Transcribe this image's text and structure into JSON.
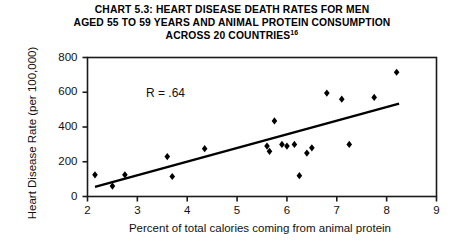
{
  "title": {
    "line1": "CHART 5.3: HEART DISEASE DEATH RATES FOR MEN",
    "line2": "AGED 55 TO 59 YEARS AND ANIMAL PROTEIN CONSUMPTION",
    "line3": "ACROSS 20 COUNTRIES",
    "footnote_marker": "16"
  },
  "annotation": {
    "correlation": "R =  .64"
  },
  "chart_data": {
    "type": "scatter",
    "title": "CHART 5.3: HEART DISEASE DEATH RATES FOR MEN AGED 55 TO 59 YEARS AND ANIMAL PROTEIN CONSUMPTION ACROSS 20 COUNTRIES",
    "xlabel": "Percent of total calories coming from animal protein",
    "ylabel": "Heart Disease Rate (per 100,000)",
    "xlim": [
      2,
      9
    ],
    "ylim": [
      0,
      800
    ],
    "xticks": [
      2,
      3,
      4,
      5,
      6,
      7,
      8,
      9
    ],
    "yticks": [
      0,
      200,
      400,
      600,
      800
    ],
    "xtick_labels": [
      "2",
      "3",
      "4",
      "5",
      "6",
      "7",
      "8",
      "9"
    ],
    "ytick_labels": [
      "0",
      "200",
      "400",
      "600",
      "800"
    ],
    "grid": false,
    "legend": "none",
    "marker": "diamond",
    "marker_color": "#000000",
    "correlation_r": 0.64,
    "points": [
      {
        "x": 2.15,
        "y": 125
      },
      {
        "x": 2.5,
        "y": 60
      },
      {
        "x": 2.75,
        "y": 125
      },
      {
        "x": 3.6,
        "y": 230
      },
      {
        "x": 3.7,
        "y": 115
      },
      {
        "x": 4.35,
        "y": 275
      },
      {
        "x": 5.6,
        "y": 290
      },
      {
        "x": 5.65,
        "y": 260
      },
      {
        "x": 5.75,
        "y": 435
      },
      {
        "x": 5.9,
        "y": 300
      },
      {
        "x": 6.0,
        "y": 290
      },
      {
        "x": 6.15,
        "y": 300
      },
      {
        "x": 6.25,
        "y": 120
      },
      {
        "x": 6.4,
        "y": 250
      },
      {
        "x": 6.5,
        "y": 280
      },
      {
        "x": 6.8,
        "y": 595
      },
      {
        "x": 7.1,
        "y": 560
      },
      {
        "x": 7.25,
        "y": 300
      },
      {
        "x": 7.75,
        "y": 570
      },
      {
        "x": 8.2,
        "y": 715
      }
    ],
    "trendline": {
      "type": "linear-fit",
      "x_start": 2.15,
      "y_start": 55,
      "x_end": 8.25,
      "y_end": 535
    }
  },
  "colors": {
    "axis": "#1a1a1a",
    "marker": "#000000",
    "trendline": "#000000",
    "text": "#111111",
    "background": "#ffffff"
  }
}
